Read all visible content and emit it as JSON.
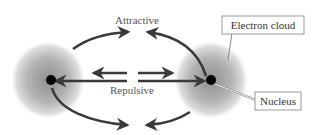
{
  "diagram": {
    "labels": {
      "attractive": "Attractive",
      "repulsive": "Repulsive",
      "electron_cloud": "Electron cloud",
      "nucleus": "Nucleus"
    },
    "atoms": [
      {
        "name": "left-atom",
        "cx": 48,
        "cy": 80,
        "cloud_r": 37
      },
      {
        "name": "right-atom",
        "cx": 211,
        "cy": 80,
        "cloud_r": 37
      }
    ],
    "colors": {
      "arrow": "#3a3a3a",
      "cloud_center": "#9a9a9a",
      "cloud_edge": "#ffffff",
      "nucleus": "#000000",
      "label_text": "#555555",
      "box_border": "#999999"
    },
    "icons": {
      "attraction_arrows": "curved-arrow-icon",
      "repulsion_arrows": "straight-arrow-icon"
    }
  }
}
